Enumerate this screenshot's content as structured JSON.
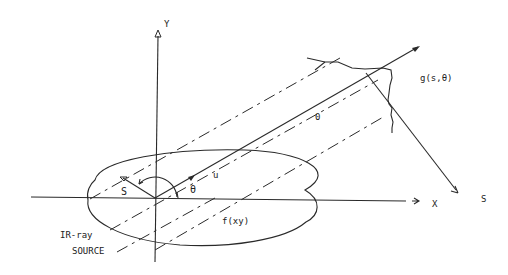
{
  "diagram": {
    "title": "",
    "labels": {
      "y_axis": "Y",
      "x_axis": "X",
      "s_axis": "S",
      "s_vector": "S",
      "theta_origin": "θ",
      "u_vector": "u",
      "projection_origin": "0",
      "projection": "g(s,θ)",
      "object": "f(xy)",
      "source_line1": "IR-ray",
      "source_line2": "SOURCE"
    },
    "colors": {
      "ink": "#2a2a2a",
      "background": "#ffffff"
    }
  }
}
